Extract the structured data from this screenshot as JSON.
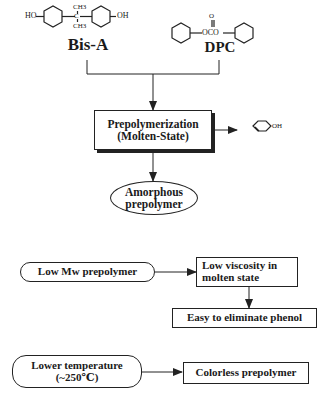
{
  "diagram": {
    "reactants": {
      "bisa": {
        "label": "Bis-A",
        "structure": {
          "left_group": "HO",
          "right_group": "OH",
          "top_methyl": "CH3",
          "bottom_methyl": "CH3",
          "center": "C"
        }
      },
      "dpc": {
        "label": "DPC",
        "structure": {
          "linker": "OCO",
          "carbonyl": "O"
        }
      }
    },
    "process": {
      "line1": "Prepolymerization",
      "line2": "(Molten-State)"
    },
    "byproduct": {
      "group": "OH",
      "name": "phenol"
    },
    "product": {
      "line1": "Amorphous",
      "line2": "prepolymer"
    },
    "rationale_1": {
      "start": "Low Mw prepolymer",
      "step1_line1": "Low viscosity in",
      "step1_line2": "molten state",
      "step2": "Easy to eliminate phenol"
    },
    "rationale_2": {
      "start_line1": "Lower temperature",
      "start_line2": "(~250℃)",
      "result": "Colorless prepolymer"
    }
  }
}
